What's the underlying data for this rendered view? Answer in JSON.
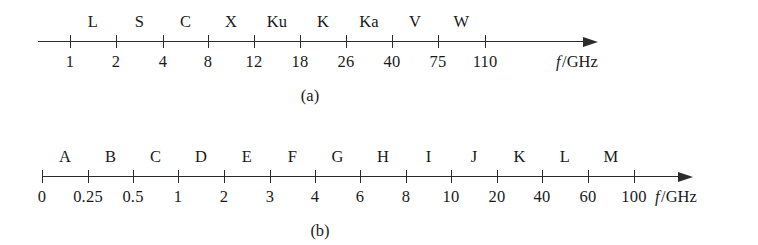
{
  "figure": {
    "background_color": "#ffffff",
    "ink_color": "#2b2b2b"
  },
  "panels": [
    {
      "id": "a",
      "caption": "(a)",
      "axis_unit_symbol": "f",
      "axis_unit_text": "/GHz",
      "tick_labels": [
        "1",
        "2",
        "4",
        "8",
        "12",
        "18",
        "26",
        "40",
        "75",
        "110"
      ],
      "band_labels": [
        "L",
        "S",
        "C",
        "X",
        "Ku",
        "K",
        "Ka",
        "V",
        "W"
      ]
    },
    {
      "id": "b",
      "caption": "(b)",
      "axis_unit_symbol": "f",
      "axis_unit_text": "/GHz",
      "tick_labels": [
        "0",
        "0.25",
        "0.5",
        "1",
        "2",
        "3",
        "4",
        "6",
        "8",
        "10",
        "20",
        "40",
        "60",
        "100"
      ],
      "band_labels": [
        "A",
        "B",
        "C",
        "D",
        "E",
        "F",
        "G",
        "H",
        "I",
        "J",
        "K",
        "L",
        "M"
      ]
    }
  ],
  "chart_data": {
    "type": "table",
    "charts": [
      {
        "panel": "a",
        "caption": "(a)",
        "xlabel": "f /GHz",
        "scale": "non-linear (ordinal boundary spacing)",
        "boundaries_ghz": [
          1,
          2,
          4,
          8,
          12,
          18,
          26,
          40,
          75,
          110
        ],
        "bands": [
          {
            "name": "L",
            "from_ghz": 1,
            "to_ghz": 2
          },
          {
            "name": "S",
            "from_ghz": 2,
            "to_ghz": 4
          },
          {
            "name": "C",
            "from_ghz": 4,
            "to_ghz": 8
          },
          {
            "name": "X",
            "from_ghz": 8,
            "to_ghz": 12
          },
          {
            "name": "Ku",
            "from_ghz": 12,
            "to_ghz": 18
          },
          {
            "name": "K",
            "from_ghz": 18,
            "to_ghz": 26
          },
          {
            "name": "Ka",
            "from_ghz": 26,
            "to_ghz": 40
          },
          {
            "name": "V",
            "from_ghz": 40,
            "to_ghz": 75
          },
          {
            "name": "W",
            "from_ghz": 75,
            "to_ghz": 110
          }
        ]
      },
      {
        "panel": "b",
        "caption": "(b)",
        "xlabel": "f /GHz",
        "scale": "non-linear (ordinal boundary spacing)",
        "boundaries_ghz": [
          0,
          0.25,
          0.5,
          1,
          2,
          3,
          4,
          6,
          8,
          10,
          20,
          40,
          60,
          100
        ],
        "bands": [
          {
            "name": "A",
            "from_ghz": 0,
            "to_ghz": 0.25
          },
          {
            "name": "B",
            "from_ghz": 0.25,
            "to_ghz": 0.5
          },
          {
            "name": "C",
            "from_ghz": 0.5,
            "to_ghz": 1
          },
          {
            "name": "D",
            "from_ghz": 1,
            "to_ghz": 2
          },
          {
            "name": "E",
            "from_ghz": 2,
            "to_ghz": 3
          },
          {
            "name": "F",
            "from_ghz": 3,
            "to_ghz": 4
          },
          {
            "name": "G",
            "from_ghz": 4,
            "to_ghz": 6
          },
          {
            "name": "H",
            "from_ghz": 6,
            "to_ghz": 8
          },
          {
            "name": "I",
            "from_ghz": 8,
            "to_ghz": 10
          },
          {
            "name": "J",
            "from_ghz": 10,
            "to_ghz": 20
          },
          {
            "name": "K",
            "from_ghz": 20,
            "to_ghz": 40
          },
          {
            "name": "L",
            "from_ghz": 40,
            "to_ghz": 60
          },
          {
            "name": "M",
            "from_ghz": 60,
            "to_ghz": 100
          }
        ]
      }
    ]
  },
  "geometry": {
    "panel_a": {
      "line_left": 38,
      "line_right": 585,
      "axis_y": 41,
      "tick_x": [
        70,
        116,
        163,
        208,
        254,
        300,
        346,
        392,
        438,
        485
      ],
      "tick_label_y": 52,
      "band_label_y": 12,
      "unit_x": 556,
      "unit_y": 52,
      "caption_x": 310,
      "caption_y": 86
    },
    "panel_b": {
      "line_left": 42,
      "line_right": 680,
      "axis_y": 53,
      "tick_x": [
        42,
        88,
        133,
        178,
        224,
        270,
        315,
        360,
        406,
        451,
        497,
        542,
        588,
        634
      ],
      "tick_label_y": 64,
      "band_label_y": 24,
      "unit_x": 655,
      "unit_y": 64,
      "caption_x": 320,
      "caption_y": 98
    }
  }
}
